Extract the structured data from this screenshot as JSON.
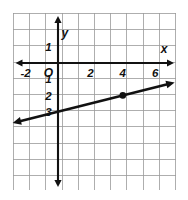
{
  "figure": {
    "kind": "coordinate-plane-line-graph",
    "axis_labels": {
      "x": "x",
      "y": "y",
      "origin": "O"
    },
    "tick_labels": {
      "x_axis": [
        "-2",
        "2",
        "4",
        "6"
      ],
      "y_axis_above": [
        "1"
      ],
      "y_axis_below": [
        "1",
        "2",
        "3"
      ]
    },
    "colors": {
      "grid": "#9a9a9a",
      "axis": "#111111",
      "line": "#111111",
      "point": "#111111",
      "background": "#ffffff"
    }
  },
  "chart_data": {
    "type": "line",
    "title": "",
    "subtitle": "",
    "xlabel": "x",
    "ylabel": "y",
    "xlim": [
      -2.8,
      7.2
    ],
    "ylim": [
      -4.9,
      1.9
    ],
    "grid": true,
    "legend": false,
    "x_ticks": [
      -2,
      2,
      4,
      6
    ],
    "x_tick_labels": [
      "-2",
      "2",
      "4",
      "6"
    ],
    "y_ticks": [
      1,
      -1,
      -2,
      -3
    ],
    "y_tick_labels": [
      "1",
      "1",
      "2",
      "3"
    ],
    "series": [
      {
        "name": "line",
        "kind": "line",
        "equation": "y = 0.25x - 3",
        "slope": 0.25,
        "y_intercept": -3,
        "x_start": -2.8,
        "y_start": -3.7,
        "x_end": 7.2,
        "y_end": -1.2,
        "arrow_start": true,
        "arrow_end": true
      }
    ],
    "points": [
      {
        "label": "",
        "x": 4,
        "y": -2,
        "marked": true
      }
    ],
    "annotations": [
      {
        "text": "O",
        "x": -0.45,
        "y": -0.42
      },
      {
        "text": "x",
        "x": 6.55,
        "y": 0.62
      },
      {
        "text": "y",
        "x": 0.42,
        "y": 1.72
      }
    ]
  }
}
